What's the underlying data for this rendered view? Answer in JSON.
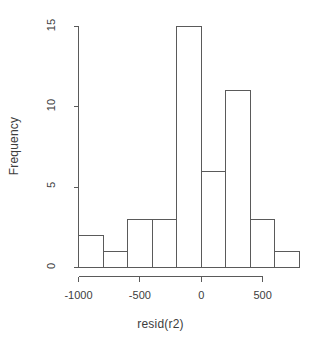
{
  "chart_data": {
    "type": "bar",
    "chart_subtype": "histogram",
    "title": "",
    "xlabel": "resid(r2)",
    "ylabel": "Frequency",
    "xlim": [
      -1000,
      800
    ],
    "ylim": [
      0,
      15
    ],
    "grid": false,
    "legend": null,
    "bin_width": 200,
    "bin_edges": [
      -1000,
      -800,
      -600,
      -400,
      -200,
      0,
      200,
      400,
      600,
      800
    ],
    "categories": [
      "-1000 to -800",
      "-800 to -600",
      "-600 to -400",
      "-400 to -200",
      "-200 to 0",
      "0 to 200",
      "200 to 400",
      "400 to 600",
      "600 to 800"
    ],
    "values": [
      2,
      1,
      3,
      3,
      15,
      6,
      11,
      3,
      1
    ],
    "xticks": [
      -1000,
      -500,
      0,
      500
    ],
    "xticklabels": [
      "-1000",
      "-500",
      "0",
      "500"
    ],
    "yticks": [
      0,
      5,
      10,
      15
    ],
    "yticklabels": [
      "0",
      "5",
      "10",
      "15"
    ]
  },
  "style": {
    "line_color": "#5a5a5a",
    "text_color": "#3d3d3d",
    "background": "#ffffff",
    "bar_fill": "none"
  }
}
